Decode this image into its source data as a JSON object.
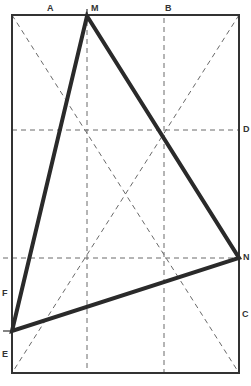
{
  "diagram": {
    "type": "geometric-construction",
    "colors": {
      "outline": "#333333",
      "dashed": "#6a6a6a",
      "triangle": "#2a2a2a",
      "background": "#ffffff"
    },
    "rectangle": {
      "x1": 12,
      "y1": 15,
      "x2": 239,
      "y2": 373
    },
    "triangle": {
      "vertices": [
        {
          "id": "M",
          "x": 87,
          "y": 16
        },
        {
          "id": "N",
          "x": 239,
          "y": 258
        },
        {
          "id": "EF",
          "x": 12,
          "y": 331
        }
      ]
    },
    "dashed_lines": [
      {
        "name": "vertical-M",
        "x1": 87,
        "y1": 12,
        "x2": 87,
        "y2": 373
      },
      {
        "name": "vertical-B",
        "x1": 164,
        "y1": 18,
        "x2": 164,
        "y2": 373
      },
      {
        "name": "horizontal-D",
        "x1": 12,
        "y1": 130,
        "x2": 239,
        "y2": 130
      },
      {
        "name": "horizontal-N",
        "x1": 3,
        "y1": 258,
        "x2": 239,
        "y2": 258
      },
      {
        "name": "diagonal-tl-br",
        "x1": 12,
        "y1": 15,
        "x2": 239,
        "y2": 373
      },
      {
        "name": "diagonal-tr-bl",
        "x1": 239,
        "y1": 15,
        "x2": 12,
        "y2": 373
      }
    ],
    "labels": [
      {
        "text": "A",
        "x": 47,
        "y": 11
      },
      {
        "text": "M",
        "x": 91,
        "y": 11
      },
      {
        "text": "B",
        "x": 165,
        "y": 11
      },
      {
        "text": "D",
        "x": 243,
        "y": 132
      },
      {
        "text": "N",
        "x": 243,
        "y": 260
      },
      {
        "text": "C",
        "x": 242,
        "y": 317
      },
      {
        "text": "F",
        "x": 2,
        "y": 296
      },
      {
        "text": "E",
        "x": 2,
        "y": 357
      }
    ]
  }
}
